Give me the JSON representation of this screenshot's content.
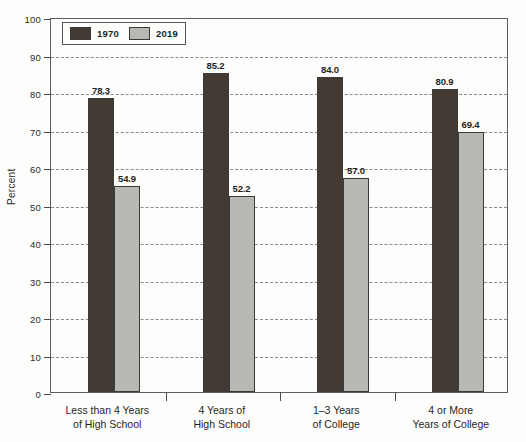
{
  "chart_data": {
    "type": "bar",
    "title": "",
    "subtitle": "",
    "xlabel": "",
    "ylabel": "Percent",
    "ylim": [
      0,
      100
    ],
    "ytick_step": 10,
    "yticks": [
      "0",
      "10",
      "20",
      "30",
      "40",
      "50",
      "60",
      "70",
      "80",
      "90",
      "100"
    ],
    "grid": true,
    "grid_style": "dashed-horizontal",
    "legend_position": "top-left-inside",
    "categories": [
      "Less than 4 Years of High School",
      "4 Years of High School",
      "1–3 Years of College",
      "4 or More Years of College"
    ],
    "category_lines": [
      [
        "Less than 4 Years",
        "of High School"
      ],
      [
        "4 Years of",
        "High School"
      ],
      [
        "1–3 Years",
        "of College"
      ],
      [
        "4 or More",
        "Years of College"
      ]
    ],
    "series": [
      {
        "name": "1970",
        "color": "#433b33",
        "values": [
          78.3,
          85.2,
          84.0,
          80.9
        ],
        "labels": [
          "78.3",
          "85.2",
          "84.0",
          "80.9"
        ]
      },
      {
        "name": "2019",
        "color": "#b9b9b4",
        "values": [
          54.9,
          52.2,
          57.0,
          69.4
        ],
        "labels": [
          "54.9",
          "52.2",
          "57.0",
          "69.4"
        ]
      }
    ]
  },
  "legend": {
    "items": [
      {
        "label": "1970",
        "color": "#433b33"
      },
      {
        "label": "2019",
        "color": "#b9b9b4"
      }
    ]
  },
  "axis": {
    "y_title": "Percent"
  },
  "colors": {
    "series_1970": "#433b33",
    "series_2019": "#b9b9b4",
    "frame": "#5d5d5d",
    "gridline": "#8a8a8a",
    "text": "#1f1f1f",
    "background": "#fdfdfb"
  }
}
